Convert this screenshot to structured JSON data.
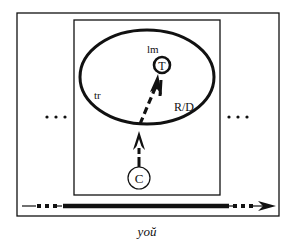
{
  "diagram": {
    "labels": {
      "landmark": "lm",
      "trajector": "tr",
      "target": "T",
      "conceptualizer": "C",
      "region": "R/D",
      "dots_left": "...",
      "dots_right": "..."
    },
    "caption": "yoŭ",
    "colors": {
      "stroke": "#111111",
      "background": "#ffffff"
    }
  }
}
